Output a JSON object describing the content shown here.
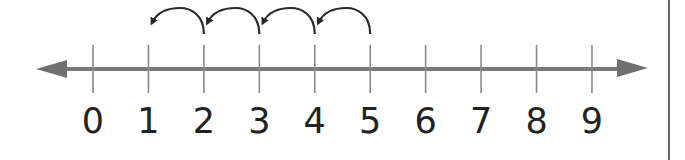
{
  "number_line": {
    "labels": [
      "0",
      "1",
      "2",
      "3",
      "4",
      "5",
      "6",
      "7",
      "8",
      "9"
    ],
    "start_value": 0,
    "end_value": 9,
    "line_color": "#7a7a7a",
    "tick_color": "#8a8a8a",
    "label_color": "#222222",
    "arc_color": "#2a2a2a",
    "border_color": "#666666"
  },
  "hops": [
    {
      "from": 5,
      "to": 4
    },
    {
      "from": 4,
      "to": 3
    },
    {
      "from": 3,
      "to": 2
    },
    {
      "from": 2,
      "to": 1
    }
  ]
}
